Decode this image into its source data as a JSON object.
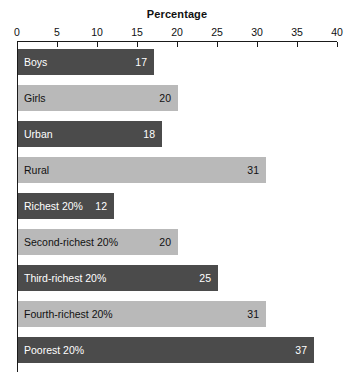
{
  "chart_data": {
    "type": "bar",
    "orientation": "horizontal",
    "title": "Percentage",
    "xlabel": "",
    "ylabel": "",
    "xlim": [
      0,
      40
    ],
    "xticks": [
      0,
      5,
      10,
      15,
      20,
      25,
      30,
      35,
      40
    ],
    "xtick_labels": [
      "0",
      "5",
      "10",
      "15",
      "20",
      "25",
      "30",
      "35",
      "40"
    ],
    "grid": false,
    "legend": "none",
    "categories": [
      "Boys",
      "Girls",
      "Urban",
      "Rural",
      "Richest 20%",
      "Second-richest 20%",
      "Third-richest 20%",
      "Fourth-richest 20%",
      "Poorest 20%"
    ],
    "values": [
      17,
      20,
      18,
      31,
      12,
      20,
      25,
      31,
      37
    ],
    "value_labels": [
      "17",
      "20",
      "18",
      "31",
      "12",
      "20",
      "25",
      "31",
      "37"
    ],
    "bar_colors": [
      "#4b4b4b",
      "#b9b9b9",
      "#4b4b4b",
      "#b9b9b9",
      "#4b4b4b",
      "#b9b9b9",
      "#4b4b4b",
      "#b9b9b9",
      "#4b4b4b"
    ],
    "bar_shades": [
      "dark",
      "light",
      "dark",
      "light",
      "dark",
      "light",
      "dark",
      "light",
      "dark"
    ],
    "colors": {
      "dark_bar": "#4b4b4b",
      "light_bar": "#b9b9b9",
      "axis": "#1a1a1a",
      "background": "#ffffff",
      "dark_bar_text": "#ffffff",
      "light_bar_text": "#111111"
    }
  }
}
